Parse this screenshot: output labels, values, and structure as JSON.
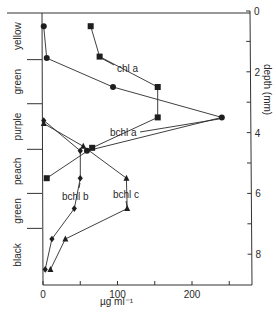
{
  "chart_data": {
    "type": "line",
    "title": "",
    "xlabel": "µg ml⁻¹",
    "ylabel": "depth (mm)",
    "xlim": [
      0,
      280
    ],
    "ylim": [
      9.0,
      0
    ],
    "x_ticks": [
      0,
      50,
      100,
      150,
      200,
      250
    ],
    "x_tick_labels": [
      "0",
      "",
      "100",
      "",
      "200",
      ""
    ],
    "y_ticks": [
      0,
      1,
      2,
      3,
      4,
      5,
      6,
      7,
      8
    ],
    "y_tick_labels": [
      "0",
      "",
      "2",
      "",
      "4",
      "",
      "6",
      "",
      "8"
    ],
    "y_axis_position": "right",
    "grid": false,
    "legend": "inline labels",
    "layers": [
      {
        "name": "yellow",
        "top": 0.05,
        "bottom": 1.6
      },
      {
        "name": "green",
        "top": 1.6,
        "bottom": 3.05
      },
      {
        "name": "purple",
        "top": 3.05,
        "bottom": 4.55
      },
      {
        "name": "peach",
        "top": 4.55,
        "bottom": 6.0
      },
      {
        "name": "green",
        "top": 6.0,
        "bottom": 7.15
      },
      {
        "name": "black",
        "top": 7.15,
        "bottom": 9.0
      }
    ],
    "series": [
      {
        "name": "chl a",
        "marker": "square",
        "points": [
          [
            64,
            0.5
          ],
          [
            76,
            1.5
          ],
          [
            154,
            2.5
          ],
          [
            154,
            3.5
          ],
          [
            66,
            4.5
          ],
          [
            5,
            5.5
          ]
        ]
      },
      {
        "name": "bchl a",
        "marker": "circle",
        "points": [
          [
            1,
            0.5
          ],
          [
            5,
            1.55
          ],
          [
            94,
            2.5
          ],
          [
            240,
            3.5
          ],
          [
            59,
            4.6
          ]
        ]
      },
      {
        "name": "bchl b",
        "marker": "diamond",
        "points": [
          [
            1,
            3.6
          ],
          [
            50,
            4.6
          ],
          [
            50,
            5.5
          ],
          [
            42,
            6.5
          ],
          [
            12,
            7.5
          ],
          [
            3,
            8.5
          ]
        ]
      },
      {
        "name": "bchl c",
        "marker": "triangle",
        "points": [
          [
            1,
            3.7
          ],
          [
            54,
            4.45
          ],
          [
            112,
            5.5
          ],
          [
            113,
            6.5
          ],
          [
            30,
            7.5
          ],
          [
            10,
            8.5
          ]
        ]
      }
    ],
    "series_labels": [
      {
        "name": "chl a",
        "text": "chl a"
      },
      {
        "name": "bchl a",
        "text": "bchl a"
      },
      {
        "name": "bchl b",
        "text": "bchl b"
      },
      {
        "name": "bchl c",
        "text": "bchl c"
      }
    ]
  }
}
